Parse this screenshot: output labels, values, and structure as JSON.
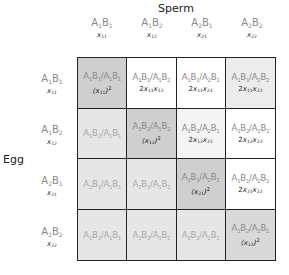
{
  "labels": {
    "sperm": "Sperm",
    "egg": "Egg"
  },
  "columns": [
    {
      "a": "1",
      "b": "1",
      "freq": "11"
    },
    {
      "a": "1",
      "b": "2",
      "freq": "12"
    },
    {
      "a": "2",
      "b": "1",
      "freq": "21"
    },
    {
      "a": "2",
      "b": "2",
      "freq": "22"
    }
  ],
  "rows": [
    {
      "a": "1",
      "b": "1",
      "freq": "11"
    },
    {
      "a": "1",
      "b": "2",
      "freq": "12"
    },
    {
      "a": "2",
      "b": "1",
      "freq": "21"
    },
    {
      "a": "2",
      "b": "2",
      "freq": "22"
    }
  ],
  "cells": [
    {
      "genotype": "A1B1/A1B1",
      "freq_type": "square",
      "i": "11",
      "j": "",
      "bg": "#cfcfcf",
      "faded": false
    },
    {
      "genotype": "A1B1/A1B2",
      "freq_type": "product",
      "i": "11",
      "j": "12",
      "bg": "#ffffff",
      "faded": false
    },
    {
      "genotype": "A1B1/A2B1",
      "freq_type": "product",
      "i": "11",
      "j": "21",
      "bg": "#ffffff",
      "faded": false
    },
    {
      "genotype": "A1B1/A2B2",
      "freq_type": "product",
      "i": "11",
      "j": "22",
      "bg": "#ececec",
      "faded": false
    },
    {
      "genotype": "A1B2/A1B1",
      "freq_type": "none",
      "i": "",
      "j": "",
      "bg": "#e6e6e6",
      "faded": true
    },
    {
      "genotype": "A1B2/A1B2",
      "freq_type": "square",
      "i": "12",
      "j": "",
      "bg": "#cfcfcf",
      "faded": false
    },
    {
      "genotype": "A1B2/A2B1",
      "freq_type": "product",
      "i": "12",
      "j": "21",
      "bg": "#f4f4f4",
      "faded": false
    },
    {
      "genotype": "A1B2/A2B2",
      "freq_type": "product",
      "i": "12",
      "j": "22",
      "bg": "#ffffff",
      "faded": false
    },
    {
      "genotype": "A2B1/A1B1",
      "freq_type": "none",
      "i": "",
      "j": "",
      "bg": "#e6e6e6",
      "faded": true
    },
    {
      "genotype": "A2B1/A1B2",
      "freq_type": "none",
      "i": "",
      "j": "",
      "bg": "#e6e6e6",
      "faded": true
    },
    {
      "genotype": "A2B1/A2B1",
      "freq_type": "square",
      "i": "21",
      "j": "",
      "bg": "#cfcfcf",
      "faded": false
    },
    {
      "genotype": "A2B1/A2B2",
      "freq_type": "product",
      "i": "21",
      "j": "22",
      "bg": "#ffffff",
      "faded": false
    },
    {
      "genotype": "A2B2/A1B1",
      "freq_type": "none",
      "i": "",
      "j": "",
      "bg": "#e6e6e6",
      "faded": true
    },
    {
      "genotype": "A2B2/A1B2",
      "freq_type": "none",
      "i": "",
      "j": "",
      "bg": "#e6e6e6",
      "faded": true
    },
    {
      "genotype": "A2B2/A2B1",
      "freq_type": "none",
      "i": "",
      "j": "",
      "bg": "#e6e6e6",
      "faded": true
    },
    {
      "genotype": "A2B2/A2B2",
      "freq_type": "square",
      "i": "22",
      "j": "",
      "bg": "#d9d9d9",
      "faded": false
    }
  ]
}
